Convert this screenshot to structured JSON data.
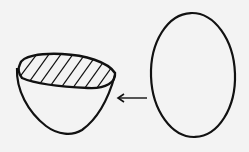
{
  "figure": {
    "colors": {
      "background": "#f3f3f3",
      "stroke": "#111111"
    },
    "elements": [
      {
        "name": "cut-bowl",
        "label": ""
      },
      {
        "name": "arrow",
        "direction": "left"
      },
      {
        "name": "oval",
        "label": ""
      }
    ]
  }
}
